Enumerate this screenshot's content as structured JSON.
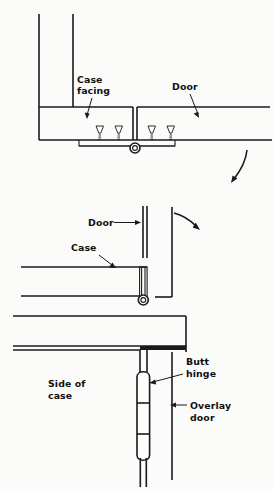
{
  "figure": {
    "background_color": "#fbfbfa",
    "line_color": "#1a1a1a",
    "width": 275,
    "height": 489
  },
  "top_view": {
    "name": "Flush door with butt hinge — plan section",
    "labels": {
      "case_facing": "Case\nfacing",
      "case_facing_line1": "Case",
      "case_facing_line2": "facing",
      "door": "Door"
    },
    "screw_count": 4,
    "swing_arrow": "curved-arrow-down-left"
  },
  "bottom_view": {
    "name": "Overlay door with butt hinge — section and elevation",
    "labels": {
      "door": "Door",
      "case": "Case",
      "side_of_case_line1": "Side of",
      "side_of_case_line2": "case",
      "butt_hinge_line1": "Butt",
      "butt_hinge_line2": "hinge",
      "overlay_door_line1": "Overlay",
      "overlay_door_line2": "door"
    },
    "hinge_knuckle_segments": 3,
    "swing_arrow": "curved-arrow-down-right"
  }
}
